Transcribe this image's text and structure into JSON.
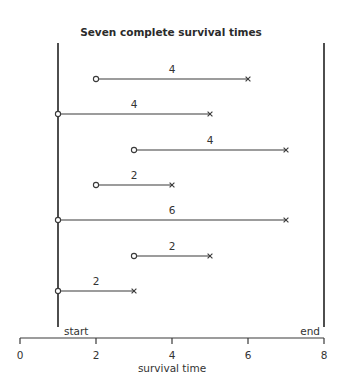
{
  "chart_data": {
    "type": "line",
    "title": "Seven complete survival times",
    "xlabel": "survival time",
    "ylabel": "",
    "xlim": [
      0,
      8
    ],
    "xticks": [
      0,
      2,
      4,
      6,
      8
    ],
    "xtick_labels": [
      "0",
      "2",
      "4",
      "6",
      "8"
    ],
    "grid": false,
    "legend": null,
    "reference_lines": [
      {
        "name": "start",
        "x": 1,
        "label": "start"
      },
      {
        "name": "end",
        "x": 8,
        "label": "end"
      }
    ],
    "series": [
      {
        "name": "subject-1",
        "start": 2,
        "end": 6,
        "duration": 4,
        "label": "4"
      },
      {
        "name": "subject-2",
        "start": 1,
        "end": 5,
        "duration": 4,
        "label": "4"
      },
      {
        "name": "subject-3",
        "start": 3,
        "end": 7,
        "duration": 4,
        "label": "4"
      },
      {
        "name": "subject-4",
        "start": 2,
        "end": 4,
        "duration": 2,
        "label": "2"
      },
      {
        "name": "subject-5",
        "start": 1,
        "end": 7,
        "duration": 6,
        "label": "6"
      },
      {
        "name": "subject-6",
        "start": 3,
        "end": 5,
        "duration": 2,
        "label": "2"
      },
      {
        "name": "subject-7",
        "start": 1,
        "end": 3,
        "duration": 2,
        "label": "2"
      }
    ],
    "markers": {
      "entry": "open-circle",
      "event": "x-cross"
    }
  },
  "colors": {
    "line": "#3a3a3a",
    "text": "#333333",
    "background": "#ffffff"
  }
}
